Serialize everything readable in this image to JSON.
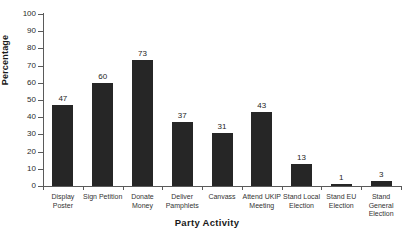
{
  "chart_data": {
    "type": "bar",
    "title": "",
    "xlabel": "Party Activity",
    "ylabel": "Percentage",
    "categories": [
      "Display Poster",
      "Sign Petition",
      "Donate Money",
      "Deliver Pamphlets",
      "Canvass",
      "Attend UKIP Meeting",
      "Stand Local Election",
      "Stand EU Election",
      "Stand General Election"
    ],
    "category_lines": [
      [
        "Display",
        "Poster"
      ],
      [
        "Sign Petition"
      ],
      [
        "Donate",
        "Money"
      ],
      [
        "Deliver",
        "Pamphlets"
      ],
      [
        "Canvass"
      ],
      [
        "Attend UKIP",
        "Meeting"
      ],
      [
        "Stand Local",
        "Election"
      ],
      [
        "Stand EU",
        "Election"
      ],
      [
        "Stand",
        "General",
        "Election"
      ]
    ],
    "values": [
      47,
      60,
      73,
      37,
      31,
      43,
      13,
      1,
      3
    ],
    "ylim": [
      0,
      100
    ],
    "ytick_labels": [
      "100",
      "90",
      "80",
      "70",
      "60",
      "50",
      "40",
      "30",
      "20",
      "10",
      "0"
    ],
    "ytick_values": [
      100,
      90,
      80,
      70,
      60,
      50,
      40,
      30,
      20,
      10,
      0
    ],
    "grid": false,
    "legend": false,
    "bar_color": "#262626",
    "axis_color": "#5a5a5a",
    "background_color": "#ffffff"
  }
}
